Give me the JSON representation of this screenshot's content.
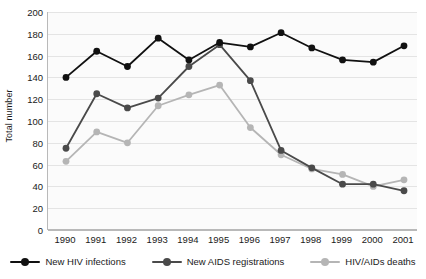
{
  "chart_data": {
    "type": "line",
    "title": "",
    "xlabel": "",
    "ylabel": "Total number",
    "categories": [
      "1990",
      "1991",
      "1992",
      "1993",
      "1994",
      "1995",
      "1996",
      "1997",
      "1998",
      "1999",
      "2000",
      "2001"
    ],
    "ylim": [
      0,
      200
    ],
    "yticks": [
      0,
      20,
      40,
      60,
      80,
      100,
      120,
      140,
      160,
      180,
      200
    ],
    "grid": true,
    "legend_position": "bottom",
    "series": [
      {
        "name": "New HIV infections",
        "color": "#111111",
        "values": [
          140,
          164,
          150,
          176,
          156,
          172,
          168,
          181,
          167,
          156,
          154,
          169
        ]
      },
      {
        "name": "New AIDS registrations",
        "color": "#4a4a4a",
        "values": [
          75,
          125,
          112,
          121,
          150,
          170,
          137,
          73,
          57,
          42,
          42,
          36
        ]
      },
      {
        "name": "HIV/AIDs deaths",
        "color": "#b5b5b5",
        "values": [
          63,
          90,
          80,
          114,
          124,
          133,
          94,
          69,
          56,
          51,
          40,
          46
        ]
      }
    ]
  },
  "axis": {
    "y_title": "Total number"
  }
}
